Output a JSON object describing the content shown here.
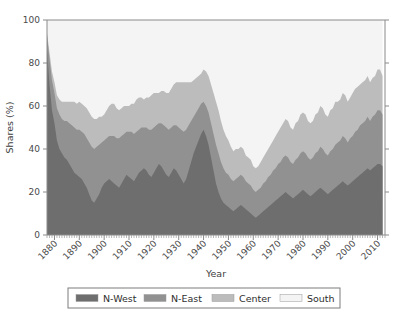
{
  "chart_data": {
    "type": "area",
    "stacked": true,
    "title": "",
    "xlabel": "Year",
    "ylabel": "Shares (%)",
    "xlim": [
      1877,
      2013
    ],
    "ylim": [
      0,
      100
    ],
    "grid": false,
    "legend_position": "bottom",
    "xticks": [
      1880,
      1890,
      1900,
      1910,
      1920,
      1930,
      1940,
      1950,
      1960,
      1970,
      1980,
      1990,
      2000,
      2010
    ],
    "xtick_labels": [
      "1880",
      "1890",
      "1900",
      "1910",
      "1920",
      "1930",
      "1940",
      "1950",
      "1960",
      "1970",
      "1980",
      "1990",
      "2000",
      "2010"
    ],
    "yticks": [
      0,
      20,
      40,
      60,
      80,
      100
    ],
    "ytick_labels": [
      "0",
      "20",
      "40",
      "60",
      "80",
      "100"
    ],
    "colors": {
      "n_west": "#6e6e6e",
      "n_east": "#919191",
      "center": "#bcbcbc",
      "south": "#f4f4f4"
    },
    "x": [
      1877,
      1878,
      1879,
      1880,
      1881,
      1882,
      1883,
      1884,
      1885,
      1886,
      1887,
      1888,
      1889,
      1890,
      1891,
      1892,
      1893,
      1894,
      1895,
      1896,
      1897,
      1898,
      1899,
      1900,
      1901,
      1902,
      1903,
      1904,
      1905,
      1906,
      1907,
      1908,
      1909,
      1910,
      1911,
      1912,
      1913,
      1914,
      1915,
      1916,
      1917,
      1918,
      1919,
      1920,
      1921,
      1922,
      1923,
      1924,
      1925,
      1926,
      1927,
      1928,
      1929,
      1930,
      1931,
      1932,
      1933,
      1934,
      1935,
      1936,
      1937,
      1938,
      1939,
      1940,
      1941,
      1942,
      1943,
      1944,
      1945,
      1946,
      1947,
      1948,
      1949,
      1950,
      1951,
      1952,
      1953,
      1954,
      1955,
      1956,
      1957,
      1958,
      1959,
      1960,
      1961,
      1962,
      1963,
      1964,
      1965,
      1966,
      1967,
      1968,
      1969,
      1970,
      1971,
      1972,
      1973,
      1974,
      1975,
      1976,
      1977,
      1978,
      1979,
      1980,
      1981,
      1982,
      1983,
      1984,
      1985,
      1986,
      1987,
      1988,
      1989,
      1990,
      1991,
      1992,
      1993,
      1994,
      1995,
      1996,
      1997,
      1998,
      1999,
      2000,
      2001,
      2002,
      2003,
      2004,
      2005,
      2006,
      2007,
      2008,
      2009,
      2010,
      2011,
      2012
    ],
    "series": [
      {
        "name": "N-West",
        "color": "#6e6e6e",
        "values": [
          86,
          70,
          58,
          52,
          44,
          40,
          38,
          36,
          35,
          33,
          31,
          29,
          28,
          27,
          26,
          24,
          22,
          19,
          16,
          15,
          17,
          19,
          22,
          24,
          25,
          26,
          25,
          24,
          23,
          22,
          24,
          26,
          28,
          27,
          26,
          25,
          27,
          29,
          30,
          31,
          30,
          28,
          27,
          29,
          31,
          33,
          32,
          30,
          28,
          27,
          29,
          31,
          30,
          28,
          26,
          24,
          26,
          30,
          34,
          38,
          41,
          44,
          47,
          49,
          46,
          42,
          36,
          30,
          24,
          20,
          17,
          15,
          14,
          13,
          12,
          11,
          12,
          13,
          14,
          13,
          12,
          11,
          10,
          9,
          8,
          9,
          10,
          11,
          12,
          13,
          14,
          15,
          16,
          17,
          18,
          19,
          20,
          19,
          18,
          17,
          18,
          19,
          20,
          21,
          20,
          19,
          18,
          19,
          20,
          21,
          22,
          21,
          20,
          19,
          20,
          21,
          22,
          23,
          24,
          25,
          24,
          23,
          24,
          25,
          26,
          27,
          28,
          29,
          30,
          31,
          30,
          31,
          32,
          33,
          33,
          32
        ]
      },
      {
        "name": "N-East",
        "color": "#919191",
        "values": [
          7,
          12,
          14,
          14,
          15,
          16,
          16,
          17,
          18,
          19,
          20,
          21,
          21,
          22,
          22,
          23,
          23,
          24,
          25,
          25,
          24,
          23,
          21,
          20,
          20,
          20,
          21,
          22,
          22,
          23,
          22,
          21,
          20,
          21,
          22,
          22,
          21,
          20,
          20,
          19,
          20,
          21,
          22,
          21,
          20,
          19,
          20,
          21,
          22,
          22,
          21,
          20,
          21,
          22,
          23,
          24,
          23,
          21,
          19,
          17,
          16,
          15,
          14,
          13,
          14,
          15,
          16,
          17,
          18,
          18,
          17,
          16,
          15,
          15,
          14,
          14,
          14,
          14,
          14,
          14,
          13,
          13,
          13,
          12,
          12,
          12,
          12,
          13,
          13,
          14,
          14,
          15,
          15,
          16,
          16,
          17,
          17,
          17,
          16,
          16,
          17,
          17,
          18,
          18,
          18,
          17,
          17,
          17,
          18,
          18,
          19,
          19,
          18,
          18,
          19,
          19,
          20,
          20,
          20,
          21,
          21,
          20,
          21,
          21,
          22,
          22,
          23,
          23,
          23,
          24,
          23,
          24,
          24,
          25,
          25,
          24
        ]
      },
      {
        "name": "Center",
        "color": "#bcbcbc",
        "values": [
          1,
          3,
          4,
          5,
          6,
          7,
          8,
          9,
          9,
          10,
          11,
          12,
          12,
          13,
          13,
          13,
          14,
          14,
          14,
          14,
          13,
          13,
          12,
          12,
          13,
          14,
          15,
          15,
          14,
          13,
          13,
          13,
          12,
          12,
          13,
          14,
          15,
          15,
          14,
          13,
          14,
          15,
          16,
          16,
          15,
          14,
          15,
          16,
          16,
          17,
          18,
          19,
          20,
          21,
          22,
          23,
          22,
          20,
          18,
          17,
          16,
          15,
          14,
          15,
          16,
          17,
          18,
          19,
          20,
          20,
          19,
          18,
          17,
          16,
          15,
          14,
          14,
          13,
          13,
          13,
          12,
          12,
          12,
          11,
          11,
          11,
          12,
          12,
          13,
          13,
          14,
          14,
          15,
          15,
          16,
          16,
          17,
          17,
          16,
          16,
          17,
          17,
          18,
          18,
          18,
          17,
          17,
          17,
          18,
          18,
          19,
          19,
          18,
          18,
          19,
          19,
          20,
          19,
          19,
          20,
          20,
          19,
          19,
          20,
          20,
          20,
          19,
          19,
          19,
          19,
          18,
          18,
          18,
          19,
          19,
          18
        ]
      },
      {
        "name": "South",
        "color": "#f4f4f4",
        "values": [
          6,
          15,
          24,
          29,
          35,
          37,
          38,
          38,
          38,
          38,
          38,
          38,
          39,
          38,
          39,
          40,
          41,
          43,
          45,
          46,
          46,
          45,
          45,
          44,
          42,
          40,
          39,
          39,
          41,
          42,
          41,
          40,
          40,
          40,
          39,
          39,
          37,
          36,
          36,
          37,
          36,
          36,
          35,
          34,
          34,
          34,
          33,
          33,
          34,
          34,
          32,
          30,
          29,
          29,
          29,
          29,
          29,
          29,
          29,
          28,
          27,
          26,
          25,
          23,
          24,
          26,
          30,
          34,
          38,
          42,
          47,
          51,
          54,
          56,
          59,
          61,
          60,
          60,
          59,
          60,
          63,
          64,
          65,
          68,
          69,
          68,
          66,
          64,
          62,
          60,
          58,
          56,
          54,
          52,
          50,
          48,
          46,
          47,
          50,
          51,
          48,
          47,
          44,
          43,
          44,
          47,
          48,
          47,
          44,
          43,
          40,
          41,
          44,
          45,
          42,
          41,
          38,
          38,
          37,
          34,
          35,
          38,
          36,
          34,
          32,
          31,
          30,
          29,
          28,
          26,
          29,
          27,
          26,
          23,
          23,
          26
        ]
      }
    ],
    "legend_entries": [
      "N-West",
      "N-East",
      "Center",
      "South"
    ]
  }
}
